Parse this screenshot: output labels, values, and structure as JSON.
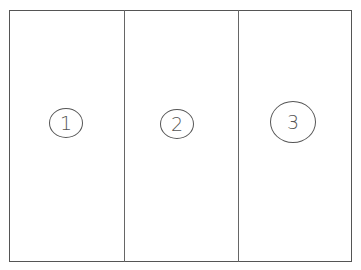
{
  "diagram": {
    "panels": [
      {
        "label": "1"
      },
      {
        "label": "2"
      },
      {
        "label": "3"
      }
    ],
    "colors": {
      "stroke": "#555555",
      "background": "#ffffff"
    }
  }
}
